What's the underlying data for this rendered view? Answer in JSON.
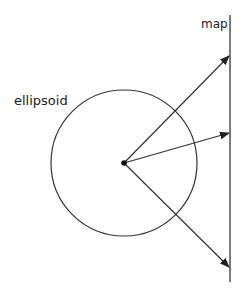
{
  "diagram": {
    "labels": {
      "map": "map",
      "ellipsoid": "ellipsoid"
    },
    "colors": {
      "stroke": "#333333",
      "text": "#222222",
      "background": "#ffffff"
    },
    "ellipsoid": {
      "shape": "circle",
      "center": [
        124,
        163
      ],
      "radius": 73
    },
    "map_line": {
      "x": 230,
      "y_start": 15,
      "y_end": 282
    },
    "projection_point": [
      124,
      163
    ],
    "arrows": [
      {
        "from": [
          124,
          163
        ],
        "to": [
          229,
          56
        ]
      },
      {
        "from": [
          124,
          163
        ],
        "to": [
          229,
          133
        ]
      },
      {
        "from": [
          124,
          163
        ],
        "to": [
          229,
          267
        ]
      }
    ]
  }
}
